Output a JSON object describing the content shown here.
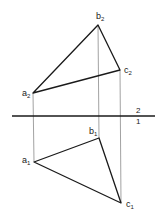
{
  "diagram": {
    "type": "orthographic-projection",
    "colors": {
      "edge": "#1a1a1a",
      "projector": "#8a8a8a",
      "axis": "#1a1a1a",
      "background": "#ffffff"
    },
    "axis": {
      "x1": 12,
      "y": 116,
      "x2": 155,
      "label_above": "2",
      "label_below": "1"
    },
    "projection_2": {
      "points": [
        {
          "id": "a2",
          "base": "a",
          "sub": "2",
          "x": 33,
          "y": 93
        },
        {
          "id": "b2",
          "base": "b",
          "sub": "2",
          "x": 98,
          "y": 25
        },
        {
          "id": "c2",
          "base": "c",
          "sub": "2",
          "x": 120,
          "y": 70
        }
      ]
    },
    "projection_1": {
      "points": [
        {
          "id": "a1",
          "base": "a",
          "sub": "1",
          "x": 34,
          "y": 162
        },
        {
          "id": "b1",
          "base": "b",
          "sub": "1",
          "x": 99,
          "y": 138
        },
        {
          "id": "c1",
          "base": "c",
          "sub": "1",
          "x": 121,
          "y": 203
        }
      ]
    }
  }
}
